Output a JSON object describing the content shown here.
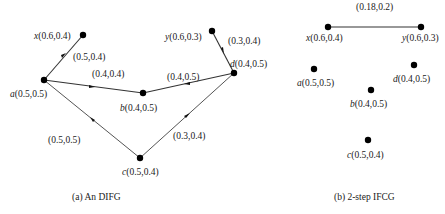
{
  "figure_a": {
    "caption": "(a) An DIFG",
    "nodes": [
      {
        "id": "x",
        "name": "x",
        "value": "(0.6,0.4)",
        "cx": 83,
        "cy": 35,
        "lx": 34,
        "ly": 39
      },
      {
        "id": "a",
        "name": "a",
        "value": "(0.5,0.5)",
        "cx": 44,
        "cy": 80,
        "lx": 10,
        "ly": 97
      },
      {
        "id": "b",
        "name": "b",
        "value": "(0.4,0.5)",
        "cx": 143,
        "cy": 93,
        "lx": 120,
        "ly": 111
      },
      {
        "id": "y",
        "name": "y",
        "value": "(0.6,0.3)",
        "cx": 212,
        "cy": 31,
        "lx": 165,
        "ly": 40
      },
      {
        "id": "d",
        "name": "d",
        "value": "(0.4,0.5)",
        "cx": 234,
        "cy": 73,
        "lx": 230,
        "ly": 67
      },
      {
        "id": "c",
        "name": "c",
        "value": "(0.5,0.4)",
        "cx": 140,
        "cy": 158,
        "lx": 122,
        "ly": 175
      }
    ],
    "edges": [
      {
        "from": "a",
        "to": "x",
        "label": "(0.5,0.4)",
        "lx": 73,
        "ly": 60
      },
      {
        "from": "a",
        "to": "b",
        "label": "(0.4,0.4)",
        "lx": 92,
        "ly": 77
      },
      {
        "from": "d",
        "to": "b",
        "label": "(0.4,0.5)",
        "lx": 167,
        "ly": 80
      },
      {
        "from": "y",
        "to": "d",
        "label": "(0.3,0.4)",
        "lx": 228,
        "ly": 44
      },
      {
        "from": "c",
        "to": "a",
        "label": "(0.5,0.5)",
        "lx": 48,
        "ly": 143
      },
      {
        "from": "c",
        "to": "d",
        "label": "(0.3,0.4)",
        "lx": 173,
        "ly": 139
      }
    ]
  },
  "figure_b": {
    "caption": "(b) 2-step IFCG",
    "nodes": [
      {
        "id": "x",
        "name": "x",
        "value": "(0.6,0.4)",
        "cx": 328,
        "cy": 27,
        "lx": 306,
        "ly": 41
      },
      {
        "id": "y",
        "name": "y",
        "value": "(0.6,0.3)",
        "cx": 421,
        "cy": 27,
        "lx": 402,
        "ly": 41
      },
      {
        "id": "a",
        "name": "a",
        "value": "(0.5,0.5)",
        "cx": 314,
        "cy": 69,
        "lx": 297,
        "ly": 86
      },
      {
        "id": "d",
        "name": "d",
        "value": "(0.4,0.5)",
        "cx": 414,
        "cy": 65,
        "lx": 393,
        "ly": 82
      },
      {
        "id": "b",
        "name": "b",
        "value": "(0.4,0.5)",
        "cx": 371,
        "cy": 90,
        "lx": 350,
        "ly": 107
      },
      {
        "id": "c",
        "name": "c",
        "value": "(0.5,0.4)",
        "cx": 368,
        "cy": 140,
        "lx": 347,
        "ly": 158
      }
    ],
    "edges": [
      {
        "from": "x",
        "to": "y",
        "label": "(0.18,0.2)",
        "lx": 356,
        "ly": 10
      }
    ]
  }
}
